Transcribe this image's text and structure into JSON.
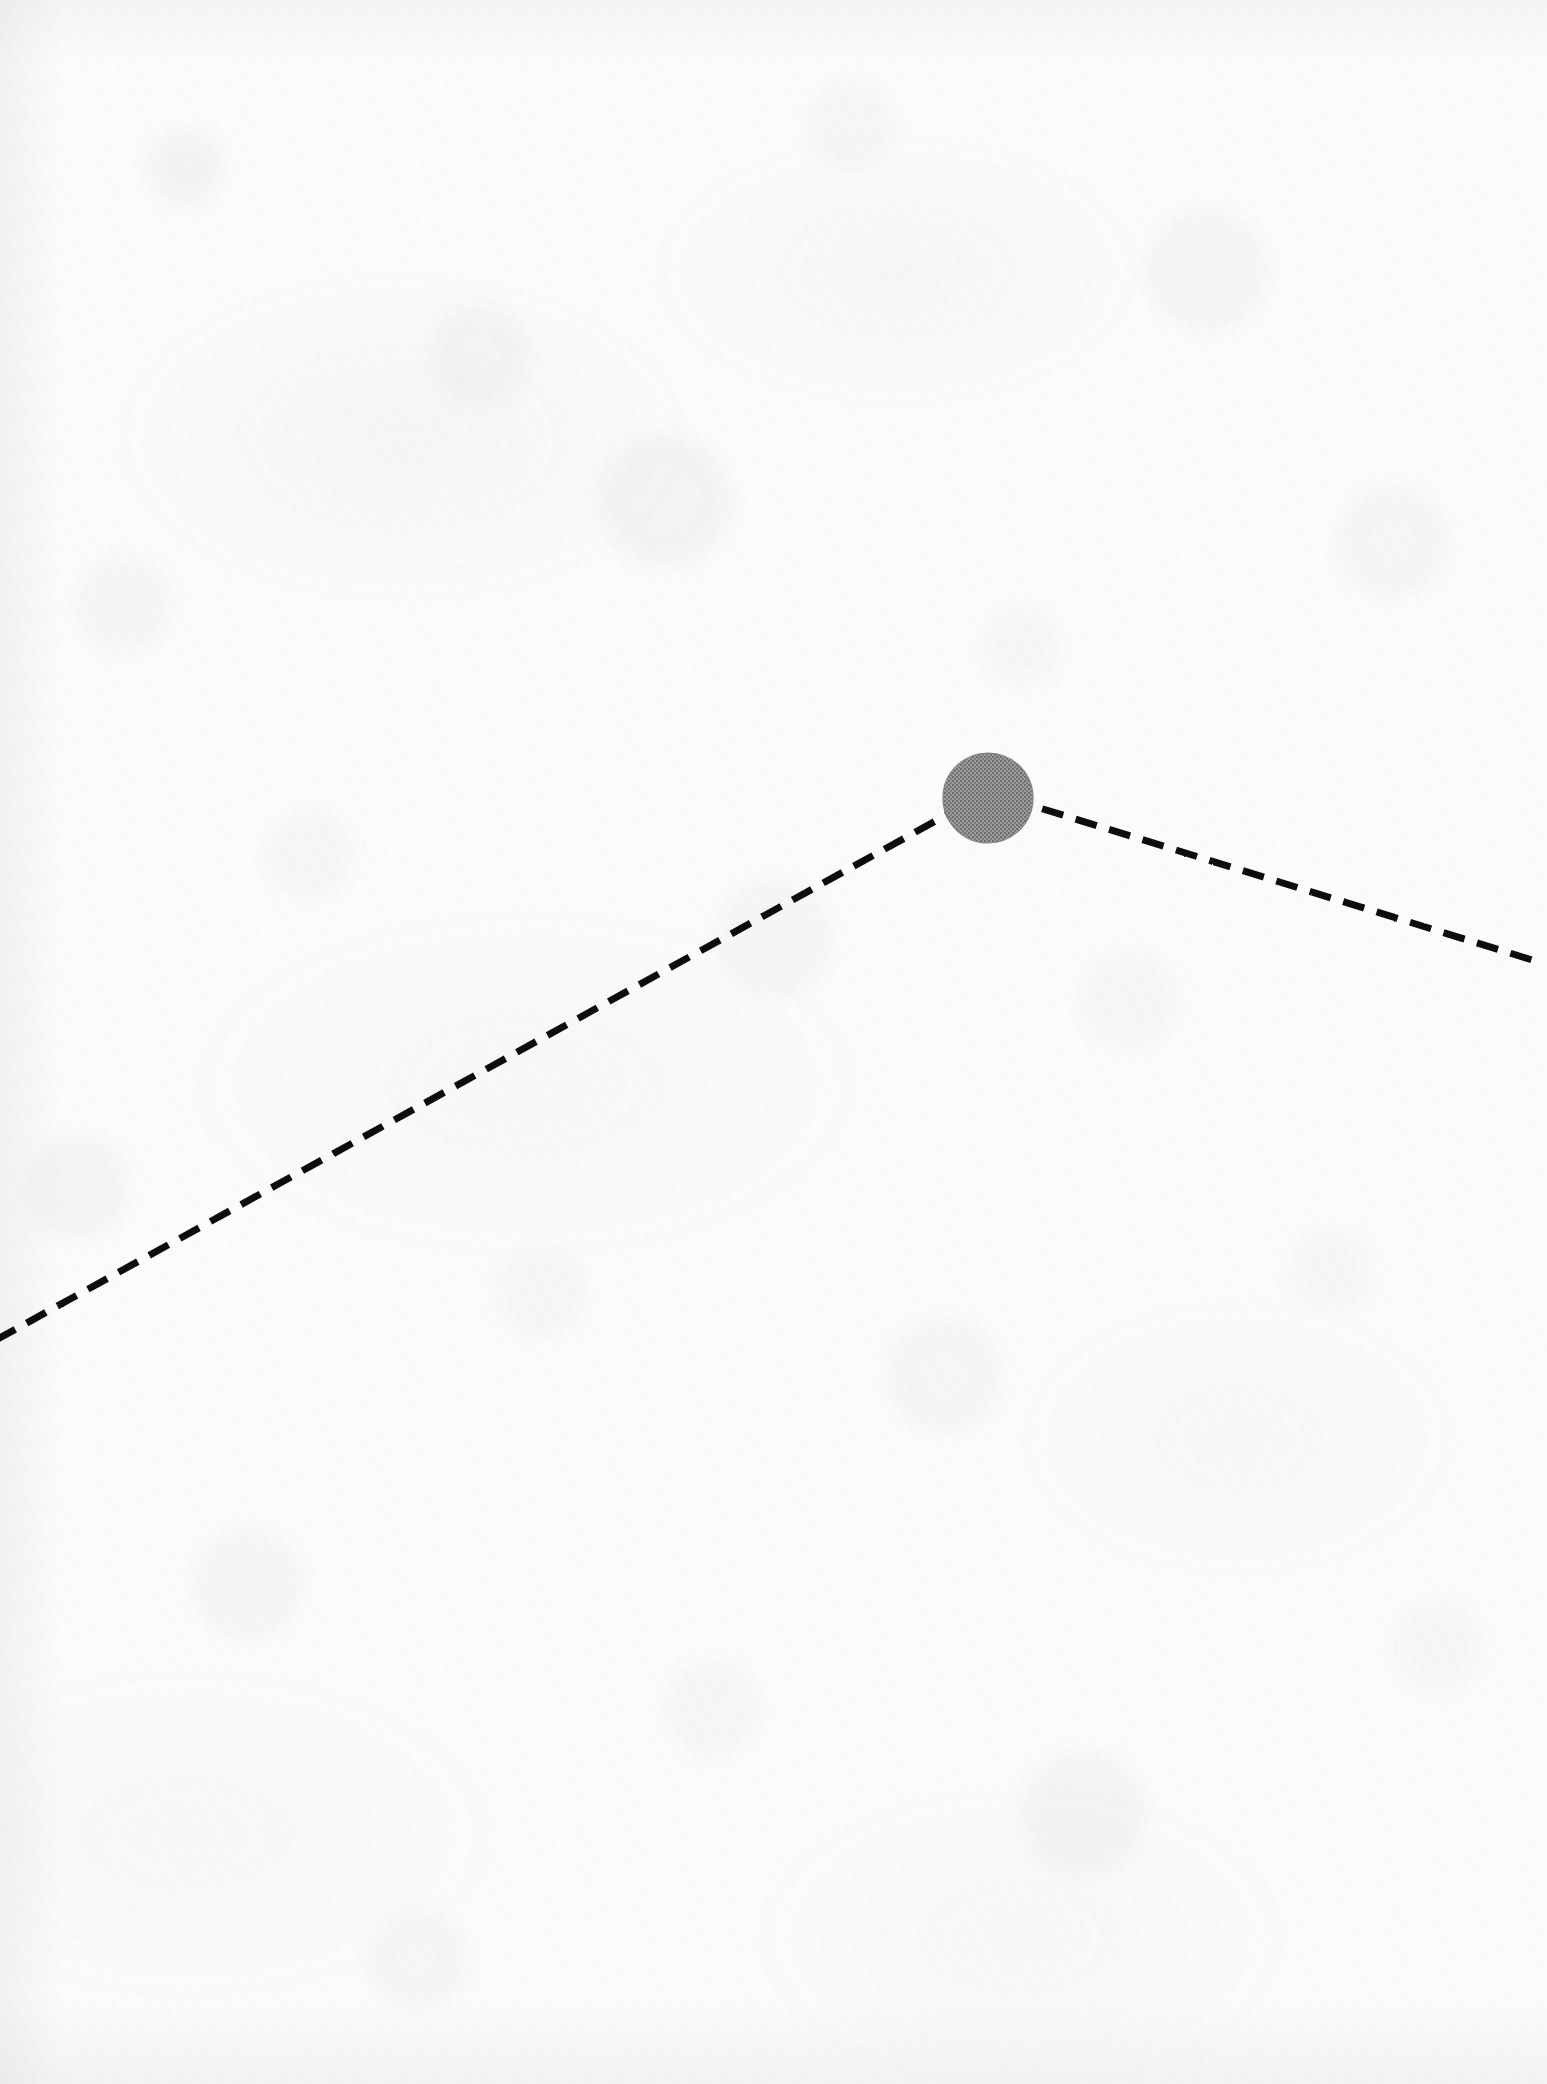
{
  "document": {
    "kind": "scanned-line-diagram",
    "page_width": 1547,
    "page_height": 2084,
    "background_color": "#fcfcfc",
    "has_visible_text": false
  },
  "palette": {
    "ink_black": "#111111",
    "marker_gray": "#8a8a8a",
    "marker_gray_edge": "#7d7d7d",
    "paper": "#fcfcfc"
  },
  "figure": {
    "title": "",
    "caption": "",
    "elements": [
      {
        "id": "trend-polyline",
        "name": "dashed-polyline",
        "style": "dashed",
        "stroke_color": "#111111",
        "stroke_width": 7,
        "dash_length": 22,
        "dash_gap": 13,
        "points": [
          {
            "x": -4,
            "y": 1340
          },
          {
            "x": 988,
            "y": 792
          },
          {
            "x": 1542,
            "y": 963
          }
        ]
      },
      {
        "id": "peak-marker",
        "name": "data-point-marker",
        "shape": "circle",
        "fill_color": "#8a8a8a",
        "center": {
          "x": 988,
          "y": 798
        },
        "radius": 45
      },
      {
        "id": "reference-rule",
        "name": "vertical-reference-line",
        "style": "solid",
        "stroke_color": "#111111",
        "stroke_width": 7,
        "x": 1418,
        "y_top": 160,
        "y_bottom": 1828
      }
    ]
  },
  "chart_data": {
    "type": "line",
    "title": "",
    "subtitle": "",
    "xlabel": "",
    "ylabel": "",
    "grid": false,
    "legend": null,
    "axis_ranges": {
      "xlim": [
        0,
        1547
      ],
      "ylim": [
        2084,
        0
      ]
    },
    "annotations": [
      {
        "kind": "vertical-rule",
        "label": "",
        "x_pixel": 1418,
        "y_span_pixels": [
          160,
          1828
        ]
      },
      {
        "kind": "point-marker",
        "label": "",
        "x_pixel": 988,
        "y_pixel": 798,
        "radius_pixels": 45,
        "color": "#8a8a8a"
      }
    ],
    "series": [
      {
        "name": "dashed-trend",
        "linestyle": "dashed",
        "color": "#111111",
        "marker": "circle-at-peak",
        "points_pixels": [
          {
            "x": -4,
            "y": 1340
          },
          {
            "x": 988,
            "y": 792
          },
          {
            "x": 1542,
            "y": 963
          }
        ]
      }
    ]
  }
}
